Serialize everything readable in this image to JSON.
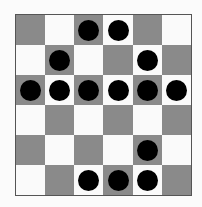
{
  "board": {
    "rows": 6,
    "cols": 6,
    "colors": {
      "dark": "#8a8a8a",
      "light": "#fafafa",
      "piece": "#000000"
    },
    "pieces": [
      [
        0,
        0,
        1,
        1,
        0,
        0
      ],
      [
        0,
        1,
        0,
        0,
        1,
        0
      ],
      [
        1,
        1,
        1,
        1,
        1,
        1
      ],
      [
        0,
        0,
        0,
        0,
        0,
        0
      ],
      [
        0,
        0,
        0,
        0,
        1,
        0
      ],
      [
        0,
        0,
        1,
        1,
        1,
        0
      ]
    ]
  }
}
